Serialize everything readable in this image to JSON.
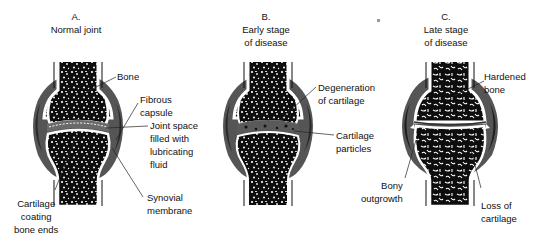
{
  "colors": {
    "background": "#ffffff",
    "capsule": "#555555",
    "capsule_dark": "#2a2a2a",
    "bone_fill": "#0d0d0d",
    "bone_outline": "#ffffff",
    "joint_space": "#6a6a6a",
    "text": "#111111"
  },
  "panels": [
    {
      "id": "A",
      "letter": "A.",
      "title": "Normal joint",
      "labels": [
        {
          "key": "bone",
          "text": "Bone"
        },
        {
          "key": "fibrous_capsule",
          "text": "Fibrous\ncapsule"
        },
        {
          "key": "joint_space",
          "text": "Joint space\nfilled with\nlubricating\nfluid"
        },
        {
          "key": "synovial_membrane",
          "text": "Synovial\nmembrane"
        },
        {
          "key": "cartilage_coating",
          "text": "Cartilage\ncoating\nbone ends"
        }
      ]
    },
    {
      "id": "B",
      "letter": "B.",
      "title": "Early stage\nof disease",
      "labels": [
        {
          "key": "degeneration",
          "text": "Degeneration\nof cartilage"
        },
        {
          "key": "cartilage_particles",
          "text": "Cartilage\nparticles"
        }
      ]
    },
    {
      "id": "C",
      "letter": "C.",
      "title": "Late stage\nof disease",
      "labels": [
        {
          "key": "hardened_bone",
          "text": "Hardened\nbone"
        },
        {
          "key": "bony_outgrowth",
          "text": "Bony\noutgrowth"
        },
        {
          "key": "loss_of_cartilage",
          "text": "Loss of\ncartilage"
        }
      ]
    }
  ]
}
